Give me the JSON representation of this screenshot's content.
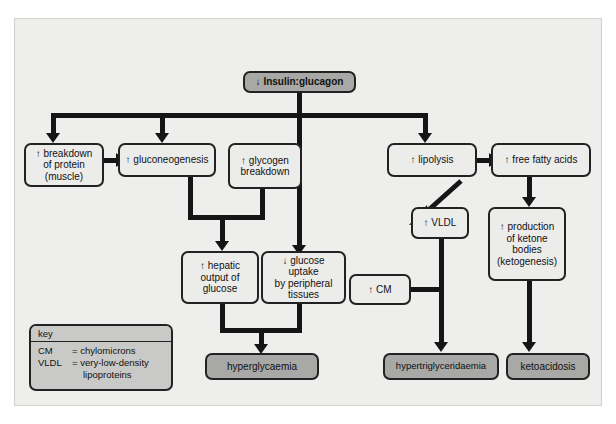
{
  "diagram": {
    "nodes": {
      "insulin_glucagon": "↓ Insulin:glucagon",
      "protein_breakdown": "↑ breakdown\nof protein\n(muscle)",
      "gluconeogenesis": "↑ gluconeogenesis",
      "glycogen_breakdown": "↑ glycogen\nbreakdown",
      "lipolysis": "↑ lipolysis",
      "free_fatty_acids": "↑ free fatty acids",
      "vldl": "↑ VLDL",
      "ketone_bodies": "↑ production\nof ketone\nbodies\n(ketogenesis)",
      "hepatic_output": "↑ hepatic\noutput of\nglucose",
      "glucose_uptake": "↓ glucose uptake\nby peripheral\ntissues",
      "cm": "↑ CM",
      "hyperglycaemia": "hyperglycaemia",
      "hypertriglyceridaemia": "hypertriglyceridaemia",
      "ketoacidosis": "ketoacidosis"
    },
    "key": {
      "header": "key",
      "entries": [
        {
          "term": "CM",
          "eq": "= chylomicrons",
          "cont": ""
        },
        {
          "term": "VLDL",
          "eq": "= very-low-density",
          "cont": "lipoproteins"
        }
      ]
    },
    "colors": {
      "canvas_background": "#eeeeec",
      "node_fill": "#ececeb",
      "outcome_fill": "#a8a8a6",
      "key_fill": "#c9c9c7",
      "line": "#151515",
      "border": "#222222"
    }
  }
}
